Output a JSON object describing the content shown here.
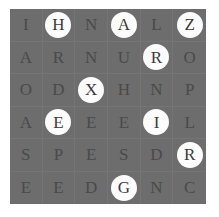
{
  "puzzle": {
    "type": "letter-grid",
    "rows": 6,
    "columns": 6,
    "background_color": "#6d6d6d",
    "letter_color": "#4a4a4a",
    "highlight_color": "#fcfcfc",
    "grid": [
      [
        {
          "letter": "I",
          "highlighted": false
        },
        {
          "letter": "H",
          "highlighted": true
        },
        {
          "letter": "N",
          "highlighted": false
        },
        {
          "letter": "A",
          "highlighted": true
        },
        {
          "letter": "L",
          "highlighted": false
        },
        {
          "letter": "Z",
          "highlighted": true
        }
      ],
      [
        {
          "letter": "A",
          "highlighted": false
        },
        {
          "letter": "R",
          "highlighted": false
        },
        {
          "letter": "N",
          "highlighted": false
        },
        {
          "letter": "U",
          "highlighted": false
        },
        {
          "letter": "R",
          "highlighted": true
        },
        {
          "letter": "O",
          "highlighted": false
        }
      ],
      [
        {
          "letter": "O",
          "highlighted": false
        },
        {
          "letter": "D",
          "highlighted": false
        },
        {
          "letter": "X",
          "highlighted": true
        },
        {
          "letter": "H",
          "highlighted": false
        },
        {
          "letter": "N",
          "highlighted": false
        },
        {
          "letter": "P",
          "highlighted": false
        }
      ],
      [
        {
          "letter": "A",
          "highlighted": false
        },
        {
          "letter": "E",
          "highlighted": true
        },
        {
          "letter": "E",
          "highlighted": false
        },
        {
          "letter": "E",
          "highlighted": false
        },
        {
          "letter": "I",
          "highlighted": true
        },
        {
          "letter": "L",
          "highlighted": false
        }
      ],
      [
        {
          "letter": "S",
          "highlighted": false
        },
        {
          "letter": "P",
          "highlighted": false
        },
        {
          "letter": "E",
          "highlighted": false
        },
        {
          "letter": "S",
          "highlighted": false
        },
        {
          "letter": "D",
          "highlighted": false
        },
        {
          "letter": "R",
          "highlighted": true
        }
      ],
      [
        {
          "letter": "E",
          "highlighted": false
        },
        {
          "letter": "E",
          "highlighted": false
        },
        {
          "letter": "D",
          "highlighted": false
        },
        {
          "letter": "G",
          "highlighted": true
        },
        {
          "letter": "N",
          "highlighted": false
        },
        {
          "letter": "C",
          "highlighted": false
        }
      ]
    ]
  }
}
